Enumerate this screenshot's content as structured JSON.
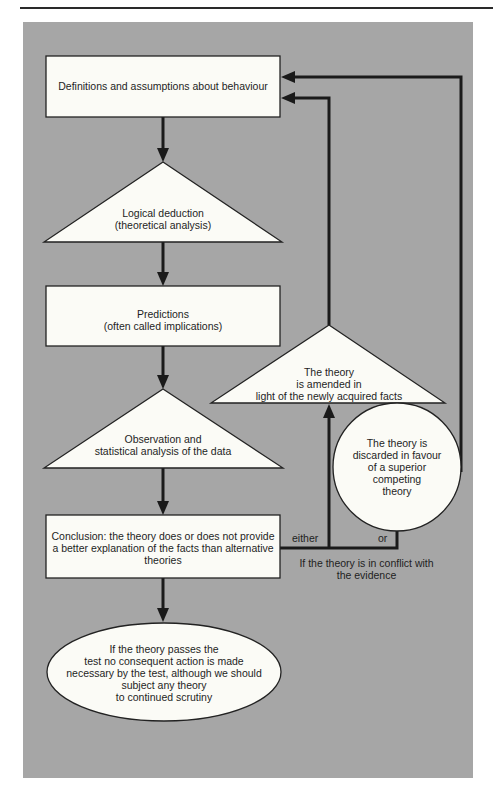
{
  "diagram": {
    "type": "flowchart",
    "nodes": {
      "definitions": {
        "shape": "rectangle",
        "text": "Definitions and assumptions about behaviour"
      },
      "deduction": {
        "shape": "triangle",
        "text": "Logical deduction\n(theoretical analysis)"
      },
      "predictions": {
        "shape": "rectangle",
        "text": "Predictions\n(often called implications)"
      },
      "observation": {
        "shape": "triangle",
        "text": "Observation and\nstatistical analysis of the data"
      },
      "conclusion": {
        "shape": "rectangle",
        "text": "Conclusion: the theory does or does not provide\na better explanation of the facts than alternative\ntheories"
      },
      "passes": {
        "shape": "ellipse",
        "text": "If the theory passes the\ntest no consequent action is made\nnecessary by the test, although we should\nsubject any theory\nto continued scrutiny"
      },
      "amended": {
        "shape": "triangle",
        "text": "The theory\nis amended in\nlight of the newly acquired facts"
      },
      "discarded": {
        "shape": "circle",
        "text": "The theory is\ndiscarded in favour\nof a superior\ncompeting\ntheory"
      }
    },
    "labels": {
      "either": "either",
      "or": "or",
      "conflict": "If the theory is in conflict with\nthe evidence"
    },
    "edges": [
      {
        "from": "definitions",
        "to": "deduction"
      },
      {
        "from": "deduction",
        "to": "predictions"
      },
      {
        "from": "predictions",
        "to": "observation"
      },
      {
        "from": "observation",
        "to": "conclusion"
      },
      {
        "from": "conclusion",
        "to": "passes"
      },
      {
        "from": "conclusion",
        "to": "amended",
        "label": "either"
      },
      {
        "from": "conclusion",
        "to": "discarded",
        "label": "or"
      },
      {
        "from": "amended",
        "to": "definitions"
      },
      {
        "from": "discarded",
        "to": "definitions"
      }
    ]
  }
}
